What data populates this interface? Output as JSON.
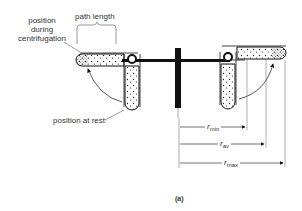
{
  "figure": {
    "panel_label": "(a)",
    "labels": {
      "position_during": "position\nduring\ncentrifugation",
      "position_during_lines": [
        "position",
        "during",
        "centrifugation"
      ],
      "path_length": "path length",
      "position_at_rest": "position at rest"
    },
    "radii": [
      {
        "name": "r",
        "sub": "min"
      },
      {
        "name": "r",
        "sub": "av"
      },
      {
        "name": "r",
        "sub": "max"
      }
    ],
    "colors": {
      "stroke": "#111111",
      "thin_line": "#555555",
      "background": "#ffffff"
    }
  }
}
